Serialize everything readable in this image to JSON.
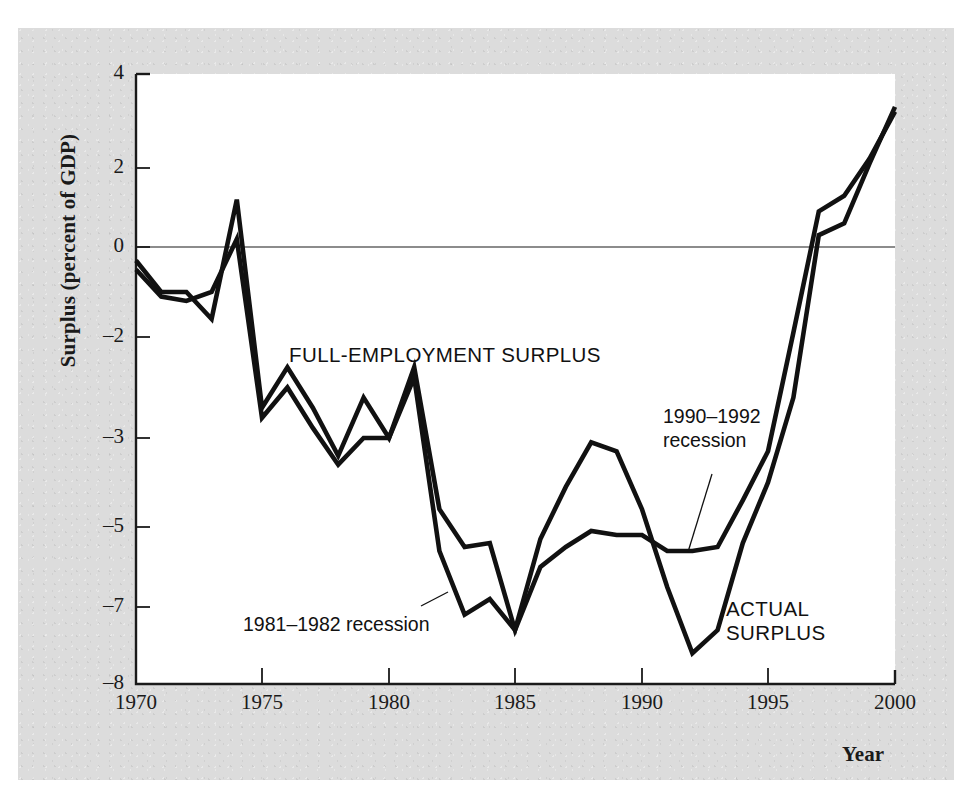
{
  "figure": {
    "background_color": "#dcdcdc",
    "plot_background_color": "#ffffff",
    "axis_color": "#1a1a1a",
    "series_color": "#111111"
  },
  "axis_titles": {
    "y": "Surplus (percent of GDP)",
    "x": "Year"
  },
  "y_ticks": [
    {
      "label": "4",
      "value": 4,
      "y": 74
    },
    {
      "label": "2",
      "value": 2,
      "y": 168
    },
    {
      "label": "0",
      "value": 0,
      "y": 247
    },
    {
      "label": "–2",
      "value": -2,
      "y": 337
    },
    {
      "label": "–3",
      "value": -3,
      "y": 438
    },
    {
      "label": "–5",
      "value": -5,
      "y": 527
    },
    {
      "label": "–7",
      "value": -7,
      "y": 607
    },
    {
      "label": "–8",
      "value": -8,
      "y": 684
    }
  ],
  "x_ticks": [
    {
      "label": "1970",
      "value": 1970,
      "x": 136
    },
    {
      "label": "1975",
      "value": 1975,
      "x": 262
    },
    {
      "label": "1980",
      "value": 1980,
      "x": 389
    },
    {
      "label": "1985",
      "value": 1985,
      "x": 515
    },
    {
      "label": "1990",
      "value": 1990,
      "x": 642
    },
    {
      "label": "1995",
      "value": 1995,
      "x": 768
    },
    {
      "label": "2000",
      "value": 2000,
      "x": 895
    }
  ],
  "series_labels": [
    {
      "name": "full-employment-surplus",
      "text": "FULL-EMPLOYMENT SURPLUS",
      "x": 289,
      "y": 343
    },
    {
      "name": "actual-surplus",
      "text": "ACTUAL\nSURPLUS",
      "line1": "ACTUAL",
      "line2": "SURPLUS",
      "x": 726,
      "y": 597
    }
  ],
  "annotations": [
    {
      "name": "recession-1981-1982",
      "line1": "1981–1982 recession",
      "line2": "",
      "x": 243,
      "y": 613,
      "leader": {
        "x1": 421,
        "y1": 606,
        "x2": 448,
        "y2": 592
      }
    },
    {
      "name": "recession-1990-1992",
      "line1": "1990–1992",
      "line2": "recession",
      "x": 663,
      "y": 405,
      "leader": {
        "x1": 688,
        "y1": 552,
        "x2": 712,
        "y2": 474
      }
    }
  ],
  "chart_data": {
    "type": "line",
    "title": "",
    "xlabel": "Year",
    "ylabel": "Surplus (percent of GDP)",
    "xlim": [
      1970,
      2000
    ],
    "ylim": [
      -8,
      4
    ],
    "grid": false,
    "zero_line": true,
    "legend": "inline-labels",
    "y_tick_values": [
      4,
      2,
      0,
      -2,
      -3,
      -5,
      -7,
      -8
    ],
    "x_tick_values": [
      1970,
      1975,
      1980,
      1985,
      1990,
      1995,
      2000
    ],
    "x": [
      1970,
      1971,
      1972,
      1973,
      1974,
      1975,
      1976,
      1977,
      1978,
      1979,
      1980,
      1981,
      1982,
      1983,
      1984,
      1985,
      1986,
      1987,
      1988,
      1989,
      1990,
      1991,
      1992,
      1993,
      1994,
      1995,
      1996,
      1997,
      1998,
      1999,
      2000
    ],
    "series": [
      {
        "name": "FULL-EMPLOYMENT SURPLUS",
        "values": [
          -0.3,
          -1.0,
          -1.0,
          -1.6,
          1.2,
          -2.7,
          -2.3,
          -2.7,
          -3.4,
          -2.6,
          -3.0,
          -2.3,
          -4.6,
          -5.5,
          -5.4,
          -7.3,
          -6.0,
          -5.5,
          -5.1,
          -5.2,
          -5.2,
          -5.6,
          -5.6,
          -5.5,
          -4.4,
          -3.3,
          -1.9,
          0.9,
          1.3,
          2.2,
          3.2
        ]
      },
      {
        "name": "ACTUAL SURPLUS",
        "values": [
          -0.5,
          -1.1,
          -1.2,
          -1.0,
          0.2,
          -2.8,
          -2.5,
          -2.9,
          -3.6,
          -3.0,
          -3.0,
          -2.4,
          -5.6,
          -7.1,
          -6.8,
          -7.3,
          -5.3,
          -4.1,
          -3.1,
          -3.3,
          -4.6,
          -6.5,
          -7.6,
          -7.3,
          -5.4,
          -4.0,
          -2.6,
          0.3,
          0.6,
          2.1,
          3.3
        ]
      }
    ]
  }
}
